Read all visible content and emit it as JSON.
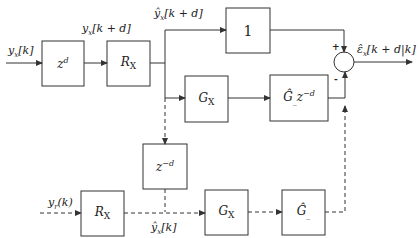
{
  "blocks": {
    "delay_forward": "z^d",
    "rx_top": "R_X",
    "unity": "1",
    "gx_top": "G_X",
    "ghat_delay": "Ĝ_ z^-d",
    "delay_back": "z^-d",
    "rx_bottom": "R_X",
    "gx_bottom": "G_X",
    "ghat_bottom": "Ĝ_"
  },
  "signals": {
    "input": "y_x[k]",
    "after_delay": "y_x[k+d]",
    "after_rx": "ŷ_x[k+d]",
    "output": "ε̂_x[k+d|k]",
    "reference": "y_r(k)",
    "bottom_mid": "ŷ_x[k]"
  },
  "summing_junction": {
    "plus": "+",
    "minus": "-"
  }
}
